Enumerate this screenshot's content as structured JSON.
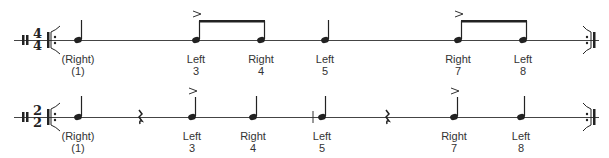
{
  "rows": [
    {
      "time_signature": {
        "top": "4",
        "bottom": "4"
      },
      "notes": [
        {
          "hand": "(Right)",
          "count": "(1)",
          "accent": false
        },
        {
          "hand": "Left",
          "count": "3",
          "accent": true
        },
        {
          "hand": "Right",
          "count": "4",
          "accent": false
        },
        {
          "hand": "Left",
          "count": "5",
          "accent": false
        },
        {
          "hand": "Right",
          "count": "7",
          "accent": true
        },
        {
          "hand": "Left",
          "count": "8",
          "accent": false
        }
      ]
    },
    {
      "time_signature": {
        "top": "2",
        "bottom": "2"
      },
      "notes": [
        {
          "hand": "(Right)",
          "count": "(1)",
          "accent": false
        },
        {
          "hand": "Left",
          "count": "3",
          "accent": true
        },
        {
          "hand": "Right",
          "count": "4",
          "accent": false
        },
        {
          "hand": "Left",
          "count": "5",
          "accent": false
        },
        {
          "hand": "Right",
          "count": "7",
          "accent": true
        },
        {
          "hand": "Left",
          "count": "8",
          "accent": false
        }
      ]
    }
  ]
}
